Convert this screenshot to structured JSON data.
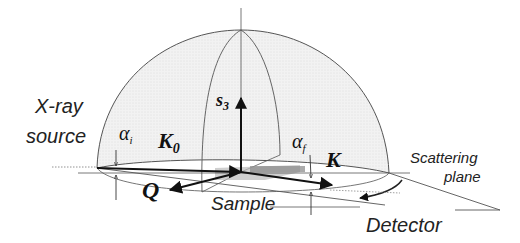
{
  "figure": {
    "labels": {
      "source_line1": "X-ray",
      "source_line2": "source",
      "alpha_i": "α",
      "alpha_i_sub": "i",
      "alpha_f": "α",
      "alpha_f_sub": "f",
      "k0": "K",
      "k0_sub": "0",
      "k": "K",
      "s3": "s",
      "s3_sub": "3",
      "q": "Q",
      "sample": "Sample",
      "scattering_line1": "Scattering",
      "scattering_line2": "plane",
      "detector": "Detector"
    },
    "colors": {
      "line": "#444444",
      "vector": "#111111",
      "dome_fill": "#eeeeee",
      "sample_fill": "#9a9a9a",
      "shadow_fill": "#c8c8c8"
    }
  }
}
